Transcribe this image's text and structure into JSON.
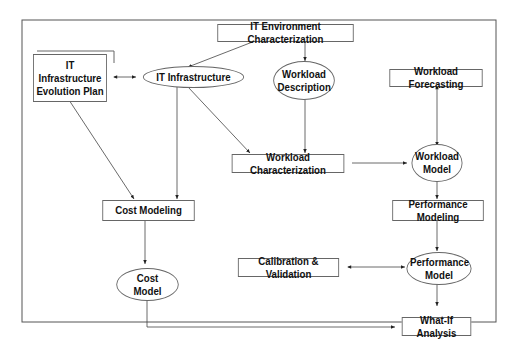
{
  "diagram": {
    "nodes": {
      "it_env_char": {
        "label": "IT Environment Characterization",
        "shape": "rectangle"
      },
      "it_infra_plan": {
        "label": "IT Infrastructure Evolution Plan",
        "shape": "rectangle"
      },
      "it_infra": {
        "label": "IT Infrastructure",
        "shape": "ellipse"
      },
      "workload_desc": {
        "label": "Workload Description",
        "shape": "ellipse"
      },
      "workload_forecast": {
        "label": "Workload Forecasting",
        "shape": "rectangle"
      },
      "workload_char": {
        "label": "Workload Characterization",
        "shape": "rectangle"
      },
      "workload_model": {
        "label": "Workload Model",
        "shape": "ellipse"
      },
      "cost_modeling": {
        "label": "Cost Modeling",
        "shape": "rectangle"
      },
      "perf_modeling": {
        "label": "Performance Modeling",
        "shape": "rectangle"
      },
      "calib_valid": {
        "label": "Calibration & Validation",
        "shape": "rectangle"
      },
      "perf_model": {
        "label": "Performance Model",
        "shape": "ellipse"
      },
      "cost_model": {
        "label": "Cost Model",
        "shape": "ellipse"
      },
      "what_if": {
        "label": "What-If Analysis",
        "shape": "rectangle"
      }
    },
    "edges": [
      {
        "from": "it_env_char",
        "to": "it_infra",
        "type": "directed"
      },
      {
        "from": "it_env_char",
        "to": "workload_desc",
        "type": "directed"
      },
      {
        "from": "it_infra_plan",
        "to": "it_infra",
        "type": "bidirectional"
      },
      {
        "from": "it_infra_plan",
        "to": "cost_modeling",
        "type": "directed"
      },
      {
        "from": "it_infra",
        "to": "cost_modeling",
        "type": "directed"
      },
      {
        "from": "it_infra",
        "to": "workload_char",
        "type": "directed"
      },
      {
        "from": "workload_desc",
        "to": "workload_char",
        "type": "directed"
      },
      {
        "from": "workload_char",
        "to": "workload_model",
        "type": "directed"
      },
      {
        "from": "workload_forecast",
        "to": "workload_model",
        "type": "bidirectional"
      },
      {
        "from": "workload_model",
        "to": "perf_modeling",
        "type": "directed"
      },
      {
        "from": "perf_modeling",
        "to": "perf_model",
        "type": "directed"
      },
      {
        "from": "calib_valid",
        "to": "perf_model",
        "type": "bidirectional"
      },
      {
        "from": "perf_model",
        "to": "what_if",
        "type": "directed"
      },
      {
        "from": "cost_modeling",
        "to": "cost_model",
        "type": "directed"
      },
      {
        "from": "cost_model",
        "to": "what_if",
        "type": "directed"
      }
    ]
  }
}
